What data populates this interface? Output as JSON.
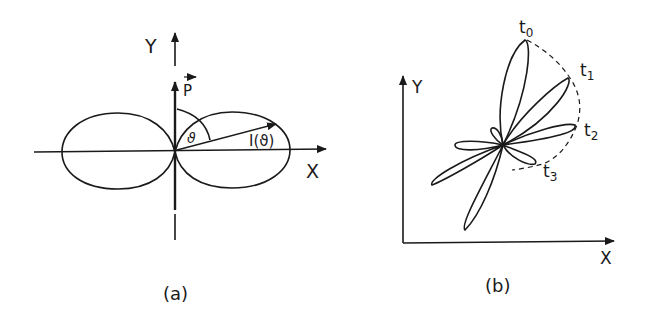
{
  "panel_a": {
    "caption": "(a)",
    "y_axis_label": "Y",
    "x_axis_label": "X",
    "vector_label": "P",
    "angle_label": "ϑ",
    "intensity_label": "I(ϑ)"
  },
  "panel_b": {
    "caption": "(b)",
    "y_axis_label": "Y",
    "x_axis_label": "X",
    "time_labels": [
      {
        "base": "t",
        "sub": "0"
      },
      {
        "base": "t",
        "sub": "1"
      },
      {
        "base": "t",
        "sub": "2"
      },
      {
        "base": "t",
        "sub": "3"
      }
    ]
  },
  "colors": {
    "ink": "#1a1a1a",
    "background": "#ffffff"
  }
}
